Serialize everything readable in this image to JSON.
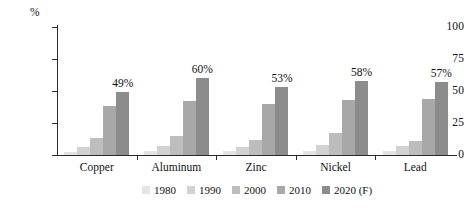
{
  "chart_data": {
    "type": "bar",
    "title": "",
    "subtitle": "",
    "xlabel": "",
    "ylabel": "%",
    "ylim": [
      0,
      100
    ],
    "yticks": [
      "0",
      "25",
      "50",
      "75",
      "100"
    ],
    "ytick_values": [
      0,
      25,
      50,
      75,
      100
    ],
    "grid": false,
    "legend_position": "bottom",
    "categories": [
      "Copper",
      "Aluminum",
      "Zinc",
      "Nickel",
      "Lead"
    ],
    "series": [
      {
        "name": "1980",
        "color": "#e4e4e4",
        "values": [
          2,
          3,
          3,
          3,
          3
        ],
        "labels": [
          "",
          "",
          "",
          "",
          ""
        ]
      },
      {
        "name": "1990",
        "color": "#d2d2d2",
        "values": [
          6,
          7,
          6,
          8,
          7
        ],
        "labels": [
          "",
          "",
          "",
          "",
          ""
        ]
      },
      {
        "name": "2000",
        "color": "#bdbdbd",
        "values": [
          13,
          15,
          12,
          17,
          11
        ],
        "labels": [
          "",
          "",
          "",
          "",
          ""
        ]
      },
      {
        "name": "2010",
        "color": "#a8a8a8",
        "values": [
          38,
          42,
          40,
          43,
          44
        ],
        "labels": [
          "",
          "",
          "",
          "",
          ""
        ]
      },
      {
        "name": "2020 (F)",
        "color": "#8c8c8c",
        "values": [
          49,
          60,
          53,
          58,
          57
        ],
        "labels": [
          "49%",
          "60%",
          "53%",
          "58%",
          "57%"
        ]
      }
    ]
  },
  "axis": {
    "unit_label": "%",
    "tick_labels": [
      "100",
      "75",
      "50",
      "25",
      "0"
    ]
  },
  "legend": {
    "items": [
      {
        "label": "1980",
        "color": "#e4e4e4"
      },
      {
        "label": "1990",
        "color": "#d2d2d2"
      },
      {
        "label": "2000",
        "color": "#bdbdbd"
      },
      {
        "label": "2010",
        "color": "#a8a8a8"
      },
      {
        "label": "2020 (F)",
        "color": "#8c8c8c"
      }
    ]
  }
}
